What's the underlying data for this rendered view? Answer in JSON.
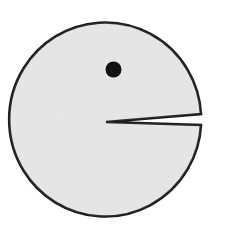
{
  "figure": {
    "colors": {
      "background": "#ffffff",
      "body_fill": "#e4e4e4",
      "outline": "#1a1a1a",
      "eye": "#111111"
    }
  }
}
